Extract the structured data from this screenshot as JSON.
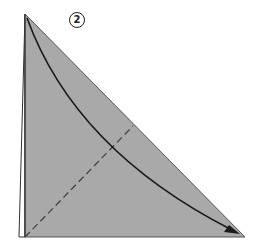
{
  "diagram": {
    "type": "origami-fold-step",
    "step_number": "2",
    "colors": {
      "paper_fill": "#a9a9a9",
      "outline": "#333333",
      "edge_strip": "#ffffff",
      "fold_arrow": "#1a1a1a",
      "valley_fold_line": "#444444"
    },
    "elements": [
      {
        "name": "folded-triangle",
        "description": "Gray right triangle with apex top-left, right angle bottom-left, tip bottom-right"
      },
      {
        "name": "paper-edge-strip",
        "description": "Thin white strip along left edge showing layered paper"
      },
      {
        "name": "valley-fold-line",
        "description": "Dashed line from bottom-left corner to midpoint of hypotenuse"
      },
      {
        "name": "fold-arrow",
        "description": "Curved arrow from top apex to bottom-right tip"
      }
    ]
  }
}
